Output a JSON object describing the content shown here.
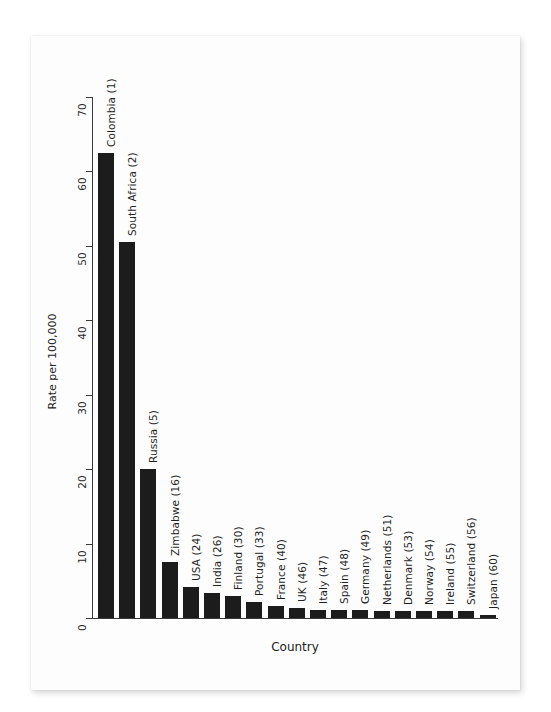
{
  "chart_data": {
    "type": "bar",
    "title": "",
    "subtitle": "",
    "xlabel": "Country",
    "ylabel": "Rate per 100,000",
    "ylim": [
      0,
      70
    ],
    "yticks": [
      0,
      10,
      20,
      30,
      40,
      50,
      60,
      70
    ],
    "ytick_labels": [
      "0",
      "10",
      "20",
      "30",
      "40",
      "50",
      "60",
      "70"
    ],
    "grid": false,
    "legend": null,
    "bar_color": "#1c1c1c",
    "categories": [
      "Colombia (1)",
      "South Africa (2)",
      "Russia (5)",
      "Zimbabwe (16)",
      "USA (24)",
      "India (26)",
      "Finland (30)",
      "Portugal (33)",
      "France (40)",
      "UK (46)",
      "Italy (47)",
      "Spain (48)",
      "Germany (49)",
      "Netherlands (51)",
      "Denmark (53)",
      "Norway (54)",
      "Ireland (55)",
      "Switzerland (56)",
      "Japan (60)"
    ],
    "values": [
      62.5,
      50.5,
      20.0,
      7.5,
      4.2,
      3.4,
      2.9,
      2.2,
      1.6,
      1.3,
      1.1,
      1.1,
      1.1,
      1.0,
      1.0,
      1.0,
      1.0,
      0.9,
      0.4
    ]
  }
}
